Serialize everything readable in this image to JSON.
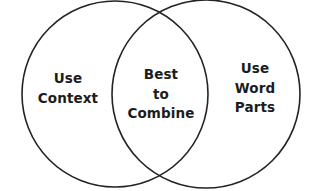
{
  "diagram": {
    "type": "venn-two-circle",
    "background_color": "#ffffff",
    "stroke_color": "#232323",
    "text_color": "#1c1c1c",
    "left_set": {
      "name": "use-context",
      "lines": [
        "Use",
        "Context"
      ]
    },
    "intersection": {
      "name": "best-to-combine",
      "lines": [
        "Best",
        "to",
        "Combine"
      ]
    },
    "right_set": {
      "name": "use-word-parts",
      "lines": [
        "Use",
        "Word",
        "Parts"
      ]
    }
  }
}
